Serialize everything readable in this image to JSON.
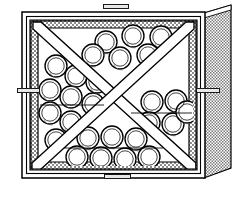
{
  "figure": {
    "type": "technical-line-drawing",
    "view": "front three-quarter perspective",
    "background_color": "#ffffff",
    "line_color": "#000000",
    "frame_fill": "#ffffff",
    "hatch_fill": "#9a9a9a",
    "side_panel_fill": "#b4b4b4",
    "bottle_fill": "#ffffff",
    "bottle_stroke": "#000000"
  },
  "callouts": {
    "top": {
      "text": "",
      "name": "top-callout"
    },
    "bottom": {
      "text": "",
      "name": "bottom-callout"
    },
    "left": {
      "text": "",
      "name": "left-callout"
    },
    "right": {
      "text": "",
      "name": "right-callout"
    }
  },
  "structure": {
    "outer_frame": {
      "x": 22,
      "y": 12,
      "width": 183,
      "height": 166
    },
    "inner_frame": {
      "x": 30,
      "y": 20,
      "width": 167,
      "height": 150
    },
    "side_panel": {
      "top_right_x": 231,
      "top_right_y": 5,
      "bottom_right_y": 168
    },
    "divider": "x-brace",
    "bin_count": 4
  },
  "bottles": {
    "radius": 11,
    "inner_radius": 8.2,
    "top_bin": [
      [
        106,
        42
      ],
      [
        133,
        36
      ],
      [
        161,
        37
      ],
      [
        120,
        58
      ],
      [
        148,
        55
      ],
      [
        93,
        55
      ]
    ],
    "left_bin": [
      [
        56,
        66
      ],
      [
        76,
        76
      ],
      [
        97,
        82
      ],
      [
        50,
        90
      ],
      [
        71,
        97
      ],
      [
        93,
        104
      ],
      [
        50,
        113
      ],
      [
        71,
        122
      ],
      [
        92,
        130
      ],
      [
        56,
        140
      ]
    ],
    "right_bin": [
      [
        152,
        102
      ],
      [
        176,
        101
      ],
      [
        149,
        123
      ],
      [
        173,
        124
      ],
      [
        186,
        112
      ]
    ],
    "bottom_bin": [
      [
        88,
        138
      ],
      [
        112,
        137
      ],
      [
        136,
        139
      ],
      [
        77,
        157
      ],
      [
        101,
        158
      ],
      [
        125,
        159
      ],
      [
        149,
        157
      ]
    ]
  }
}
